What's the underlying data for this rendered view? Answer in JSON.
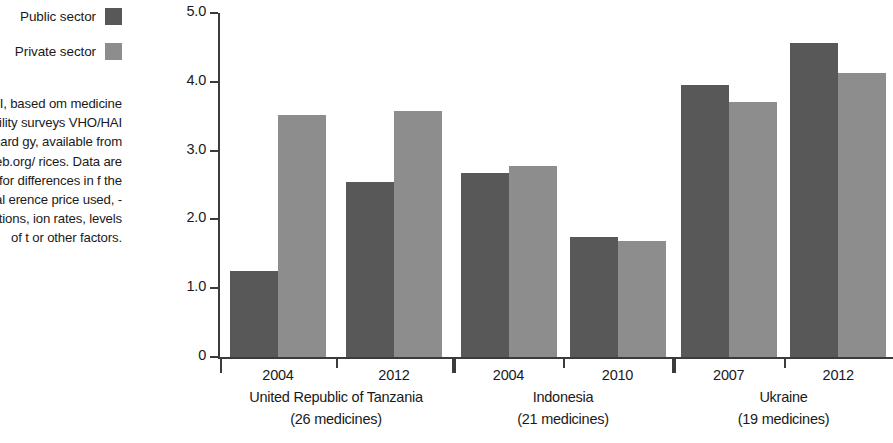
{
  "legend": {
    "items": [
      {
        "label": "Public sector",
        "swatch_color": "#585858",
        "icon": "square-swatch-icon"
      },
      {
        "label": "Private sector",
        "swatch_color": "#8d8d8d",
        "icon": "square-swatch-icon"
      }
    ]
  },
  "source_note": "WHO/HAI, based om medicine price vailability surveys VHO/HAI standard gy, available from www.haiweb.org/ rices. Data are not d for differences in f the international erence price used, -rate fluctuations, ion rates, levels of t or other factors.",
  "chart_data": {
    "type": "bar",
    "title": "",
    "subtitle": "",
    "xlabel": "",
    "ylabel": "",
    "ylim": [
      0,
      5.0
    ],
    "grid": false,
    "legend_position": "top-left",
    "y_ticks": [
      "0",
      "1.0",
      "2.0",
      "3.0",
      "4.0",
      "5.0"
    ],
    "y_tick_values": [
      0,
      1.0,
      2.0,
      3.0,
      4.0,
      5.0
    ],
    "series": [
      {
        "name": "Public sector",
        "color": "#585858",
        "values": [
          1.25,
          2.55,
          2.67,
          1.74,
          3.96,
          4.56
        ]
      },
      {
        "name": "Private sector",
        "color": "#8d8d8d",
        "values": [
          3.52,
          3.58,
          2.78,
          1.68,
          3.7,
          4.13
        ]
      }
    ],
    "categories": [
      "2004",
      "2012",
      "2004",
      "2010",
      "2007",
      "2012"
    ],
    "groups": [
      {
        "country": "United Republic of Tanzania",
        "medicines": "(26 medicines)",
        "years": [
          "2004",
          "2012"
        ],
        "public": [
          1.25,
          2.55
        ],
        "private": [
          3.52,
          3.58
        ]
      },
      {
        "country": "Indonesia",
        "medicines": "(21 medicines)",
        "years": [
          "2004",
          "2010"
        ],
        "public": [
          2.67,
          1.74
        ],
        "private": [
          2.78,
          1.68
        ]
      },
      {
        "country": "Ukraine",
        "medicines": "(19 medicines)",
        "years": [
          "2007",
          "2012"
        ],
        "public": [
          3.96,
          4.56
        ],
        "private": [
          3.7,
          4.13
        ]
      }
    ]
  },
  "colors": {
    "public": "#585858",
    "private": "#8d8d8d",
    "axis": "#3b3b3b",
    "text": "#1a1a1a",
    "background": "#ffffff"
  }
}
